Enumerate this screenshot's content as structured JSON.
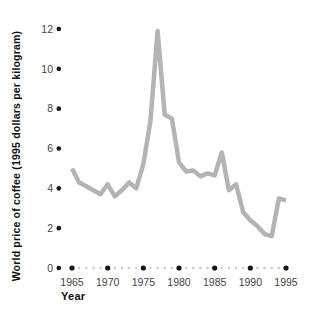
{
  "chart_data": {
    "type": "line",
    "title": "",
    "xlabel": "Year",
    "ylabel": "World price of coffee (1995 dollars per kilogram)",
    "x": [
      1965,
      1966,
      1967,
      1968,
      1969,
      1970,
      1971,
      1972,
      1973,
      1974,
      1975,
      1976,
      1977,
      1978,
      1979,
      1980,
      1981,
      1982,
      1983,
      1984,
      1985,
      1986,
      1987,
      1988,
      1989,
      1990,
      1991,
      1992,
      1993,
      1994,
      1995
    ],
    "series": [
      {
        "name": "World price of coffee (1995 dollars per kilogram)",
        "values": [
          5.0,
          4.3,
          4.1,
          3.9,
          3.7,
          4.2,
          3.6,
          3.9,
          4.3,
          4.0,
          5.2,
          7.4,
          11.9,
          7.7,
          7.5,
          5.3,
          4.85,
          4.9,
          4.6,
          4.75,
          4.65,
          5.8,
          3.9,
          4.2,
          2.8,
          2.4,
          2.1,
          1.7,
          1.6,
          3.5,
          3.4
        ]
      }
    ],
    "xlim": [
      1965,
      1995
    ],
    "ylim": [
      0,
      12
    ],
    "yticks": [
      0,
      2,
      4,
      6,
      8,
      10,
      12
    ],
    "xticks": [
      1965,
      1970,
      1975,
      1980,
      1985,
      1990,
      1995
    ],
    "grid": false,
    "legend": false,
    "line_color": "#b2b4b6",
    "axis_dot_color": "#151515",
    "minor_dot_color": "#c9c9c9",
    "tick_label_color": "#454545"
  }
}
